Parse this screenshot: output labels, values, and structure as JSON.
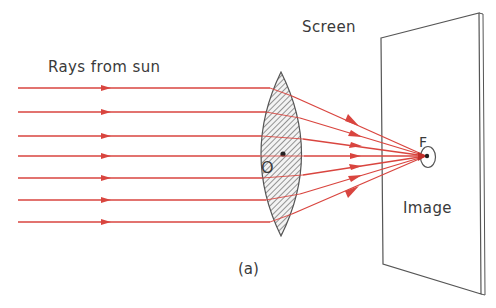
{
  "figure": {
    "caption": "(a)",
    "labels": {
      "rays": "Rays from sun",
      "screen": "Screen",
      "focal_point": "F",
      "optical_center": "O",
      "image": "Image"
    },
    "colors": {
      "ray": "#d9453f",
      "outline": "#555555",
      "hatch": "#6a6a6a",
      "text": "#3a3a3a",
      "background": "#ffffff"
    },
    "rays": {
      "count": 7,
      "y_positions": [
        88,
        112,
        136,
        156,
        178,
        200,
        222
      ],
      "start_x": 18,
      "arrow_x": 105
    },
    "lens": {
      "type": "biconvex",
      "center": [
        283,
        154
      ],
      "top": [
        281,
        72
      ],
      "bottom": [
        281,
        236
      ]
    },
    "focus": {
      "x": 426,
      "y": 156
    },
    "screen_corners": [
      [
        381,
        38
      ],
      [
        479,
        13
      ],
      [
        481,
        294
      ],
      [
        383,
        264
      ]
    ]
  }
}
